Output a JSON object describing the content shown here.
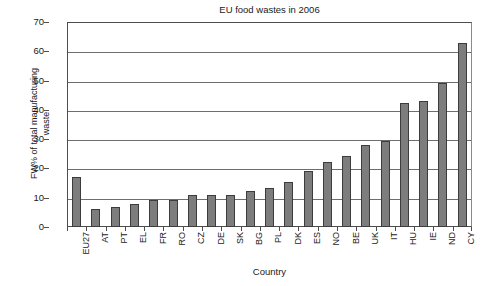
{
  "chart_data": {
    "type": "bar",
    "title": "EU food wastes in 2006",
    "xlabel": "Country",
    "ylabel": "FW% of total manufacturing waste",
    "ylabel_line1": "FW% of total manufacturing",
    "ylabel_line2": "waste",
    "ylim": [
      0,
      70
    ],
    "ytick_step": 10,
    "yticks": [
      70,
      60,
      50,
      40,
      30,
      20,
      10,
      0
    ],
    "grid": true,
    "legend": "none",
    "bar_color": "#7d7d7d",
    "bar_edge_color": "#3c3c3c",
    "axis_color": "#4d4d4d",
    "categories": [
      "EU27",
      "AT",
      "PT",
      "EL",
      "FR",
      "RO",
      "CZ",
      "DE",
      "SK",
      "BG",
      "PL",
      "DK",
      "ES",
      "NO",
      "BE",
      "UK",
      "IT",
      "HU",
      "IE",
      "ND",
      "CY"
    ],
    "values": [
      17.0,
      6.2,
      7.0,
      8.0,
      9.2,
      9.2,
      11.0,
      11.0,
      11.0,
      12.3,
      13.4,
      15.3,
      19.0,
      22.3,
      24.2,
      28.1,
      29.3,
      42.3,
      43.1,
      49.2,
      63.0
    ]
  }
}
